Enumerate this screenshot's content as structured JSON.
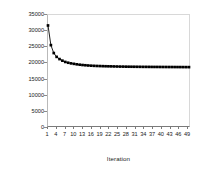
{
  "chart_data": {
    "type": "line",
    "title": "",
    "xlabel": "Iteration",
    "ylabel": "Total Travel Time (veh-min)",
    "xlim": [
      1,
      50
    ],
    "ylim": [
      0,
      35000
    ],
    "grid": false,
    "legend": null,
    "marker": "square",
    "y_ticks": [
      35000,
      30000,
      25000,
      20000,
      15000,
      10000,
      5000,
      0
    ],
    "y_tick_labels": [
      "35000",
      "30000",
      "25000",
      "20000",
      "15000",
      "10000",
      "5000",
      "0"
    ],
    "x_ticks": [
      1,
      4,
      7,
      10,
      13,
      16,
      19,
      22,
      25,
      28,
      31,
      34,
      37,
      40,
      43,
      46,
      49
    ],
    "x_tick_labels": [
      "1",
      "4",
      "7",
      "10",
      "13",
      "16",
      "19",
      "22",
      "25",
      "28",
      "31",
      "34",
      "37",
      "40",
      "43",
      "46",
      "49"
    ],
    "x": [
      1,
      2,
      3,
      4,
      5,
      6,
      7,
      8,
      9,
      10,
      11,
      12,
      13,
      14,
      15,
      16,
      17,
      18,
      19,
      20,
      21,
      22,
      23,
      24,
      25,
      26,
      27,
      28,
      29,
      30,
      31,
      32,
      33,
      34,
      35,
      36,
      37,
      38,
      39,
      40,
      41,
      42,
      43,
      44,
      45,
      46,
      47,
      48,
      49,
      50
    ],
    "values": [
      31700,
      25500,
      23000,
      21800,
      21100,
      20600,
      20200,
      19950,
      19750,
      19600,
      19450,
      19330,
      19230,
      19150,
      19080,
      19020,
      18970,
      18930,
      18900,
      18870,
      18840,
      18820,
      18800,
      18780,
      18760,
      18740,
      18730,
      18710,
      18700,
      18690,
      18680,
      18670,
      18660,
      18650,
      18645,
      18640,
      18630,
      18625,
      18620,
      18615,
      18610,
      18605,
      18600,
      18595,
      18590,
      18585,
      18580,
      18575,
      18570,
      18565
    ],
    "series_name": "Total Travel Time",
    "line_color": "#000000",
    "marker_color": "#000000",
    "background_color": "#ffffff"
  }
}
